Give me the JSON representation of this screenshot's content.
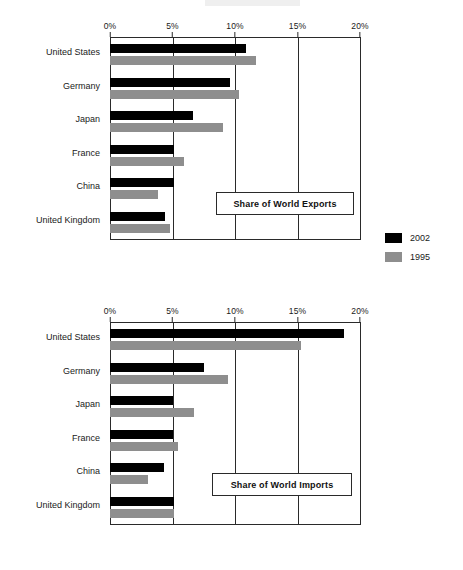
{
  "axis": {
    "ticks": [
      "0%",
      "5%",
      "10%",
      "15%",
      "20%"
    ],
    "tick_values": [
      0,
      5,
      10,
      15,
      20
    ],
    "min": 0,
    "max": 20
  },
  "legend": {
    "items": [
      {
        "label": "2002",
        "color": "#000000"
      },
      {
        "label": "1995",
        "color": "#8e8e8e"
      }
    ]
  },
  "charts": [
    {
      "id": "exports",
      "title": "Share of World Exports",
      "categories": [
        "United States",
        "Germany",
        "Japan",
        "France",
        "China",
        "United Kingdom"
      ],
      "series": [
        {
          "name": "2002",
          "color": "#000000",
          "values": [
            10.9,
            9.6,
            6.6,
            5.1,
            5.1,
            4.4
          ]
        },
        {
          "name": "1995",
          "color": "#8e8e8e",
          "values": [
            11.7,
            10.3,
            9.0,
            5.9,
            3.8,
            4.8
          ]
        }
      ]
    },
    {
      "id": "imports",
      "title": "Share of World Imports",
      "categories": [
        "United States",
        "Germany",
        "Japan",
        "France",
        "China",
        "United Kingdom"
      ],
      "series": [
        {
          "name": "2002",
          "color": "#000000",
          "values": [
            18.7,
            7.5,
            5.0,
            5.0,
            4.3,
            5.1
          ]
        },
        {
          "name": "1995",
          "color": "#8e8e8e",
          "values": [
            15.3,
            9.4,
            6.7,
            5.4,
            3.0,
            5.1
          ]
        }
      ]
    }
  ],
  "chart_data": [
    {
      "type": "bar",
      "orientation": "horizontal",
      "title": "Share of World Exports",
      "xlabel": "",
      "ylabel": "",
      "xlim": [
        0,
        20
      ],
      "xticks": [
        0,
        5,
        10,
        15,
        20
      ],
      "xticklabels": [
        "0%",
        "5%",
        "10%",
        "15%",
        "20%"
      ],
      "grid": "vertical",
      "legend_position": "right",
      "categories": [
        "United States",
        "Germany",
        "Japan",
        "France",
        "China",
        "United Kingdom"
      ],
      "series": [
        {
          "name": "2002",
          "values": [
            10.9,
            9.6,
            6.6,
            5.1,
            5.1,
            4.4
          ]
        },
        {
          "name": "1995",
          "values": [
            11.7,
            10.3,
            9.0,
            5.9,
            3.8,
            4.8
          ]
        }
      ]
    },
    {
      "type": "bar",
      "orientation": "horizontal",
      "title": "Share of World Imports",
      "xlabel": "",
      "ylabel": "",
      "xlim": [
        0,
        20
      ],
      "xticks": [
        0,
        5,
        10,
        15,
        20
      ],
      "xticklabels": [
        "0%",
        "5%",
        "10%",
        "15%",
        "20%"
      ],
      "grid": "vertical",
      "legend_position": "right",
      "categories": [
        "United States",
        "Germany",
        "Japan",
        "France",
        "China",
        "United Kingdom"
      ],
      "series": [
        {
          "name": "2002",
          "values": [
            18.7,
            7.5,
            5.0,
            5.0,
            4.3,
            5.1
          ]
        },
        {
          "name": "1995",
          "values": [
            15.3,
            9.4,
            6.7,
            5.4,
            3.0,
            5.1
          ]
        }
      ]
    }
  ]
}
